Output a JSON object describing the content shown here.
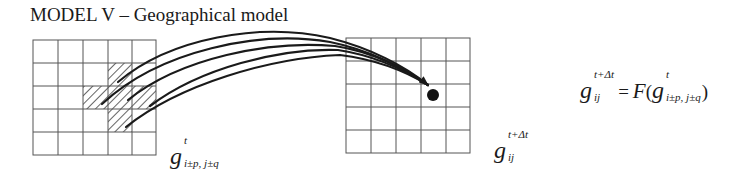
{
  "title": "MODEL V – Geographical model",
  "left_grid": {
    "rows": 5,
    "cols": 5,
    "hatched_cells": [
      [
        1,
        3
      ],
      [
        2,
        2
      ],
      [
        2,
        3
      ],
      [
        2,
        4
      ],
      [
        3,
        3
      ]
    ],
    "label": {
      "symbol": "g",
      "sup": "t",
      "sub": "i±p, j±q"
    }
  },
  "right_grid": {
    "rows": 5,
    "cols": 5,
    "target_dot": true,
    "label": {
      "symbol": "g",
      "sup": "t+Δt",
      "sub": "ij"
    }
  },
  "arrows": {
    "count": 5,
    "from": "neighbourhood cells (left grid)",
    "to": "target cell (right grid)"
  },
  "formula": {
    "lhs": {
      "symbol": "g",
      "sup": "t+Δt",
      "sub": "ij"
    },
    "equals": "=",
    "func": "F",
    "open_paren": "(",
    "arg": {
      "symbol": "g",
      "sup": "t",
      "sub": "i±p, j±q"
    },
    "close_paren": ")"
  },
  "colors": {
    "line": "#1a1a1a",
    "grid": "#555555"
  }
}
